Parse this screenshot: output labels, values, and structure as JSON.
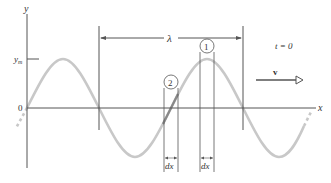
{
  "figure": {
    "axis_y_label": "y",
    "axis_x_label": "x",
    "amplitude_label": "y_m",
    "amplitude_label_base": "y",
    "amplitude_label_sub": "m",
    "origin_label": "0",
    "wavelength_label": "λ",
    "time_label": "t = 0",
    "velocity_label": "v",
    "element_1_label": "1",
    "element_2_label": "2",
    "dx_label_1": "dx",
    "dx_label_2": "dx",
    "colors": {
      "wave": "#c8c8c8",
      "lines": "#555555",
      "text": "#333333"
    }
  }
}
